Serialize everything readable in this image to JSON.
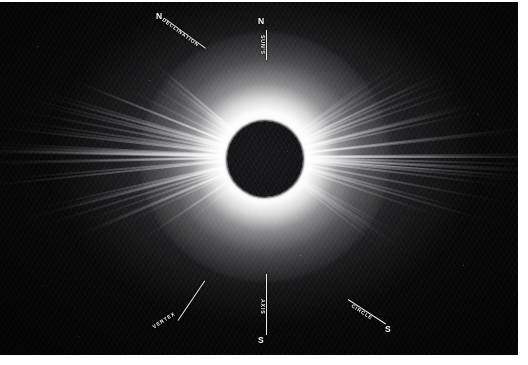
{
  "plate": {
    "title": "Total Solar Eclipse Corona",
    "background_color": "#050506",
    "paper_color": "#ffffff",
    "annotation_color": "#f2f2ee"
  },
  "subject": {
    "occulting_disk": {
      "label": "moon-disk",
      "center_x": 265,
      "center_y": 157,
      "radius": 38,
      "color": "#09090b"
    },
    "corona": {
      "label": "solar-corona",
      "glow_color": "#ffffff",
      "streamer_count": 96
    }
  },
  "annotations": [
    {
      "id": "declination",
      "cardinal": "N",
      "label": "DECLINATION",
      "position": "upper-left",
      "angle_deg": 36
    },
    {
      "id": "sun-axis-north",
      "cardinal": "N",
      "label": "SUN'S",
      "position": "top-center",
      "angle_deg": 90
    },
    {
      "id": "vertex",
      "cardinal": "",
      "label": "VERTEX",
      "position": "lower-left",
      "angle_deg": -33
    },
    {
      "id": "sun-axis-south",
      "cardinal": "S",
      "label": "AXIS",
      "position": "bottom-center",
      "angle_deg": 90
    },
    {
      "id": "declination-circle",
      "cardinal": "S",
      "label": "CIRCLE",
      "position": "lower-right",
      "angle_deg": 33
    }
  ]
}
